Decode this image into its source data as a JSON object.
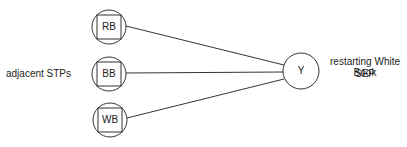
{
  "diagram": {
    "left_label": "adjacent STPs",
    "nodes": [
      {
        "id": "rb",
        "label": "RB"
      },
      {
        "id": "bb",
        "label": "BB"
      },
      {
        "id": "wb",
        "label": "WB"
      }
    ],
    "target": {
      "id": "y",
      "label": "Y"
    },
    "right_label_line1": "restarting White Book",
    "right_label_line2": "SEP",
    "stroke_color": "#333333"
  }
}
